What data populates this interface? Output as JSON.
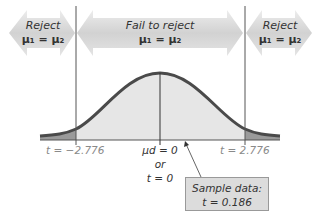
{
  "diagram": {
    "type": "two-tailed t-test decision regions",
    "regions": [
      {
        "label": "Reject",
        "hypothesis": "μ₁ = μ₂"
      },
      {
        "label": "Fail to reject",
        "hypothesis": "μ₁ = μ₂"
      },
      {
        "label": "Reject",
        "hypothesis": "μ₁ = μ₂"
      }
    ],
    "critical_values": {
      "left": "t = −2.776",
      "right": "t = 2.776"
    },
    "center_label": {
      "line1": "μd = 0",
      "line2": "or",
      "line3": "t = 0"
    },
    "sample": {
      "title": "Sample data:",
      "value": "t = 0.186"
    },
    "colors": {
      "arrow_fill": "#d4d4d4",
      "curve_stroke": "#4a4a4a",
      "fail_region_fill": "#e6e6e6",
      "reject_region_fill": "#9a9a9a",
      "box_fill": "#dcdcdc"
    }
  }
}
